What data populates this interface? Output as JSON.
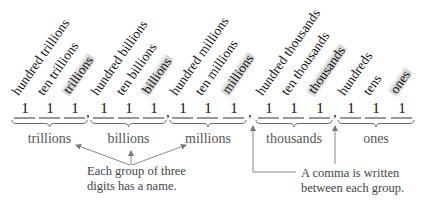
{
  "diagram": {
    "digit": "1",
    "comma": ",",
    "groups": [
      {
        "name": "trillions",
        "places": [
          "hundred trillions",
          "ten trillions",
          "trillions"
        ],
        "highlight": 2
      },
      {
        "name": "billions",
        "places": [
          "hundred billions",
          "ten billions",
          "billions"
        ],
        "highlight": 2
      },
      {
        "name": "millions",
        "places": [
          "hundred millions",
          "ten millions",
          "millions"
        ],
        "highlight": 2
      },
      {
        "name": "thousands",
        "places": [
          "hundred thousands",
          "ten thousands",
          "thousands"
        ],
        "highlight": 2
      },
      {
        "name": "ones",
        "places": [
          "hundreds",
          "tens",
          "ones"
        ],
        "highlight": 2
      }
    ],
    "annotations": {
      "group_names": [
        "Each group of three",
        "digits has a name."
      ],
      "comma_note": [
        "A comma is written",
        "between each group."
      ]
    },
    "colors": {
      "text": "#111111",
      "label_gray": "#555555",
      "line_gray": "#888888",
      "highlight": "#c8c8c8"
    }
  }
}
